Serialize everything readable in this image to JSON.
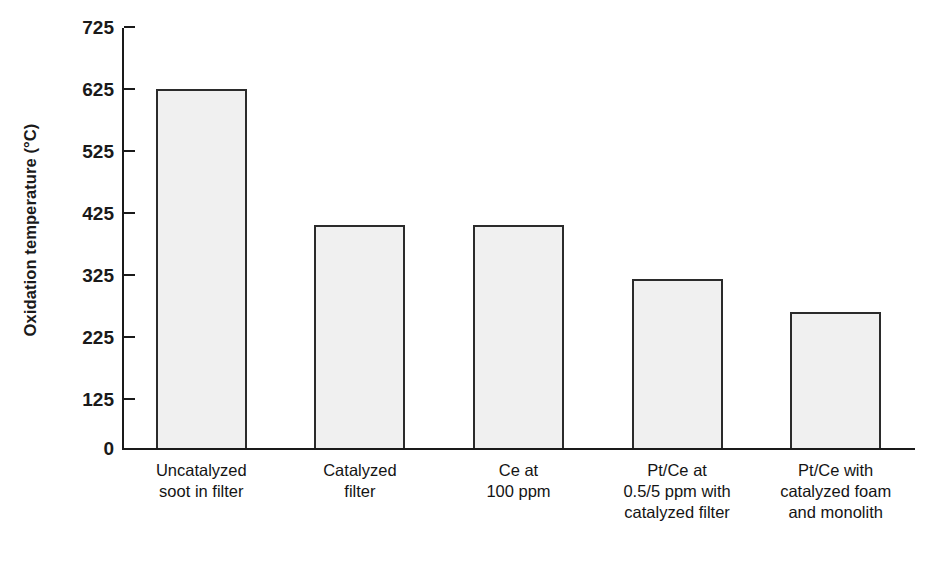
{
  "chart_data": {
    "type": "bar",
    "title": "",
    "xlabel": "",
    "ylabel": "Oxidation temperature (°C)",
    "ylim": [
      0,
      725
    ],
    "grid": false,
    "legend": null,
    "y_ticks": [
      0,
      125,
      225,
      325,
      425,
      525,
      625,
      725
    ],
    "y_tick_labels": [
      "0",
      "125",
      "225",
      "325",
      "425",
      "525",
      "625",
      "725"
    ],
    "categories": [
      "Uncatalyzed\nsoot in filter",
      "Catalyzed\nfilter",
      "Ce at\n100 ppm",
      "Pt/Ce at\n0.5/5 ppm with\ncatalyzed filter",
      "Pt/Ce with\ncatalyzed foam\nand monolith"
    ],
    "values": [
      625,
      405,
      405,
      318,
      265
    ],
    "bar_fill_color": "#f0f0f0",
    "bar_edge_color": "#2b2b2b",
    "axis_color": "#1a1a1a"
  },
  "axis": {
    "y_title": "Oxidation temperature (°C)"
  }
}
